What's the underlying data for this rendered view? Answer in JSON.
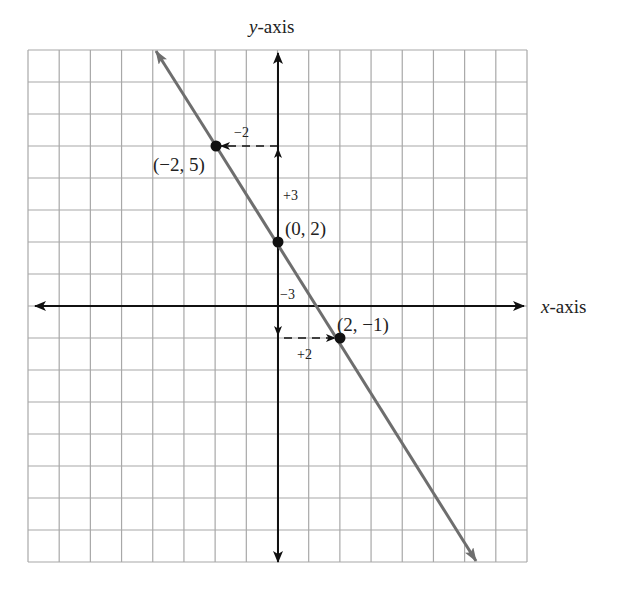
{
  "diagram": {
    "type": "coordinate-plane-line-graph",
    "axes": {
      "x_label_var": "x",
      "x_label_suffix": "-axis",
      "y_label_var": "y",
      "y_label_suffix": "-axis"
    },
    "grid": {
      "x_min": -8,
      "x_max": 8,
      "y_min": -8,
      "y_max": 8,
      "step": 1,
      "show": true
    },
    "line": {
      "slope": -1.5,
      "intercept": 2,
      "equation": "y = -3/2 x + 2",
      "color": "#6e6e6e"
    },
    "points": [
      {
        "x": -2,
        "y": 5,
        "label": "(−2, 5)"
      },
      {
        "x": 0,
        "y": 2,
        "label": "(0, 2)"
      },
      {
        "x": 2,
        "y": -1,
        "label": "(2, −1)"
      }
    ],
    "step_labels": {
      "rise_up": "+3",
      "run_left": "−2",
      "fall_down": "−3",
      "run_right": "+2"
    },
    "colors": {
      "grid": "#a8a8a8",
      "axis": "#111111",
      "line": "#6e6e6e",
      "point": "#111111"
    }
  }
}
